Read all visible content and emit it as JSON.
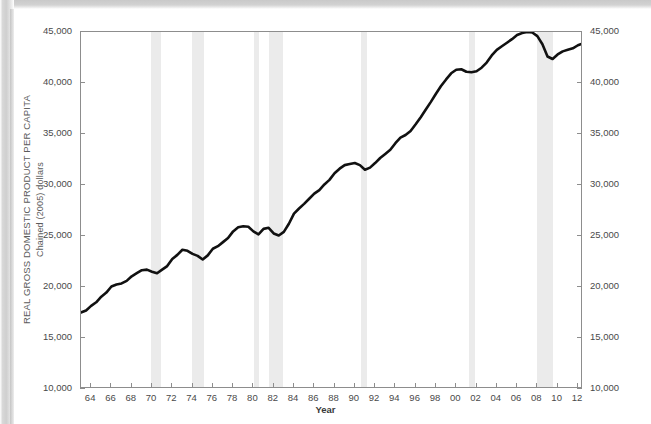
{
  "chart_data": {
    "type": "line",
    "title": "",
    "xlabel": "Year",
    "ylabel_line1": "REAL GROSS DOMESTIC PRODUCT PER CAPITA",
    "ylabel_line2": "Chained (2005) dollars",
    "xlim": [
      1963.0,
      2012.5
    ],
    "ylim": [
      10000,
      45000
    ],
    "grid": false,
    "legend": "none",
    "line_color": "#111111",
    "band_color": "#ebebeb",
    "axis_color": "#8d8d8d",
    "y_ticks_left": [
      "10,000",
      "15,000",
      "20,000",
      "25,000",
      "30,000",
      "35,000",
      "40,000",
      "45,000"
    ],
    "y_ticks_right": [
      "10,000",
      "15,000",
      "20,000",
      "25,000",
      "30,000",
      "35,000",
      "40,000",
      "45,000"
    ],
    "y_tick_values": [
      10000,
      15000,
      20000,
      25000,
      30000,
      35000,
      40000,
      45000
    ],
    "x_ticks": [
      "64",
      "66",
      "68",
      "70",
      "72",
      "74",
      "76",
      "78",
      "80",
      "82",
      "84",
      "86",
      "88",
      "90",
      "92",
      "94",
      "96",
      "98",
      "00",
      "02",
      "04",
      "06",
      "08",
      "10",
      "12"
    ],
    "x_tick_values": [
      1964,
      1966,
      1968,
      1970,
      1972,
      1974,
      1976,
      1978,
      1980,
      1982,
      1984,
      1986,
      1988,
      1990,
      1992,
      1994,
      1996,
      1998,
      2000,
      2002,
      2004,
      2006,
      2008,
      2010,
      2012
    ],
    "recession_bands": [
      {
        "label": "1969-70 recession",
        "start": 1969.92,
        "end": 1970.92
      },
      {
        "label": "1973-75 recession",
        "start": 1973.92,
        "end": 1975.17
      },
      {
        "label": "1980 recession",
        "start": 1980.08,
        "end": 1980.58
      },
      {
        "label": "1981-82 recession",
        "start": 1981.58,
        "end": 1982.92
      },
      {
        "label": "1990-91 recession",
        "start": 1990.58,
        "end": 1991.17
      },
      {
        "label": "2001 recession",
        "start": 2001.25,
        "end": 2001.83
      },
      {
        "label": "2007-09 recession",
        "start": 2007.92,
        "end": 2009.5
      }
    ],
    "x": [
      1963.0,
      1963.5,
      1964.0,
      1964.5,
      1965.0,
      1965.5,
      1966.0,
      1966.5,
      1967.0,
      1967.5,
      1968.0,
      1968.5,
      1969.0,
      1969.5,
      1970.0,
      1970.5,
      1971.0,
      1971.5,
      1972.0,
      1972.5,
      1973.0,
      1973.5,
      1974.0,
      1974.5,
      1975.0,
      1975.5,
      1976.0,
      1976.5,
      1977.0,
      1977.5,
      1978.0,
      1978.5,
      1979.0,
      1979.5,
      1980.0,
      1980.5,
      1981.0,
      1981.5,
      1982.0,
      1982.5,
      1983.0,
      1983.5,
      1984.0,
      1984.5,
      1985.0,
      1985.5,
      1986.0,
      1986.5,
      1987.0,
      1987.5,
      1988.0,
      1988.5,
      1989.0,
      1989.5,
      1990.0,
      1990.5,
      1991.0,
      1991.5,
      1992.0,
      1992.5,
      1993.0,
      1993.5,
      1994.0,
      1994.5,
      1995.0,
      1995.5,
      1996.0,
      1996.5,
      1997.0,
      1997.5,
      1998.0,
      1998.5,
      1999.0,
      1999.5,
      2000.0,
      2000.5,
      2001.0,
      2001.5,
      2002.0,
      2002.5,
      2003.0,
      2003.5,
      2004.0,
      2004.5,
      2005.0,
      2005.5,
      2006.0,
      2006.5,
      2007.0,
      2007.5,
      2008.0,
      2008.5,
      2009.0,
      2009.5,
      2010.0,
      2010.5,
      2011.0,
      2011.5,
      2012.0,
      2012.4
    ],
    "y": [
      17500,
      17700,
      18150,
      18500,
      19050,
      19450,
      20050,
      20250,
      20350,
      20600,
      21050,
      21350,
      21650,
      21700,
      21500,
      21350,
      21700,
      22050,
      22750,
      23150,
      23650,
      23550,
      23250,
      23050,
      22700,
      23100,
      23750,
      24000,
      24400,
      24800,
      25450,
      25850,
      25950,
      25900,
      25450,
      25150,
      25700,
      25800,
      25250,
      25050,
      25400,
      26200,
      27200,
      27700,
      28150,
      28650,
      29150,
      29500,
      30050,
      30500,
      31150,
      31600,
      31950,
      32050,
      32150,
      31950,
      31500,
      31700,
      32150,
      32650,
      33050,
      33450,
      34100,
      34650,
      34900,
      35300,
      35950,
      36650,
      37400,
      38150,
      38950,
      39700,
      40350,
      40950,
      41300,
      41350,
      41100,
      41050,
      41150,
      41500,
      42000,
      42700,
      43250,
      43600,
      43950,
      44300,
      44700,
      44900,
      45000,
      44950,
      44600,
      43800,
      42600,
      42350,
      42800,
      43100,
      43250,
      43400,
      43700,
      43850
    ]
  }
}
